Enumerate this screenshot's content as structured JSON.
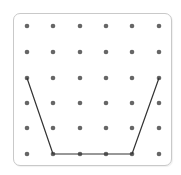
{
  "caption": "",
  "board": {
    "columns": 6,
    "rows": 6,
    "dot_color": "#666666",
    "line_color": "#333333",
    "border_color": "#c9c9c9",
    "col_x": [
      27,
      53,
      80,
      106,
      132,
      159
    ],
    "row_y": [
      26,
      52,
      78,
      103,
      128,
      154
    ]
  },
  "shape": {
    "type": "polyline",
    "description": "open trapezoid (cup shape)",
    "points_grid": [
      [
        0,
        2
      ],
      [
        1,
        5
      ],
      [
        2,
        5
      ],
      [
        3,
        5
      ],
      [
        4,
        5
      ],
      [
        5,
        2
      ]
    ]
  }
}
